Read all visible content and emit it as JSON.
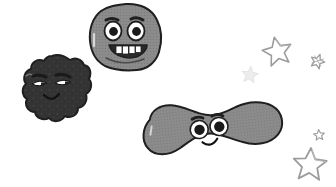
{
  "scene": {
    "title": "Cartoon germ characters illustration",
    "background_color": "#ffffff",
    "width": 336,
    "height": 187
  },
  "palette": {
    "background": "#ffffff",
    "mid_gray_body": "#8a8a8a",
    "mid_gray_body_shade": "#7b7b7b",
    "dark_body": "#333333",
    "dark_body_shade": "#262626",
    "outline_dark": "#1f1f1f",
    "outline_mid": "#4a4a4a",
    "eye_white": "#ffffff",
    "pupil": "#1a1a1a",
    "star_outline": "#9b9b9b",
    "star_fill_light": "#ededed",
    "speckle_light": "#a5a5a5",
    "speckle_dark": "#4f4f4f"
  },
  "characters": [
    {
      "id": "round-germ",
      "name": "Round smiling germ",
      "shape": "round-lumpy-blob",
      "body_color": "#8a8a8a",
      "outline_color": "#1f1f1f",
      "position": {
        "x": 90,
        "y": 3,
        "width": 72,
        "height": 68
      },
      "expression": "wide-open-grin",
      "face": {
        "eyes": 2,
        "eye_style": "large-round-white-with-black-pupil",
        "eyebrows": 2,
        "eyebrow_style": "short-thick-arched",
        "mouth": "wide-open-smile",
        "teeth": 4,
        "teeth_color": "#ffffff"
      }
    },
    {
      "id": "dark-germ",
      "name": "Dark lumpy germ",
      "shape": "cloud-lumpy-blob",
      "body_color": "#333333",
      "outline_color": "#1f1f1f",
      "position": {
        "x": 12,
        "y": 55,
        "width": 78,
        "height": 74
      },
      "expression": "sly-smirk",
      "face": {
        "eyes": 2,
        "eye_style": "narrow-almond-white-with-dark-pupil",
        "eyebrows": 2,
        "eyebrow_style": "thick-straight",
        "mouth": "small-curved-smile",
        "teeth": 0,
        "texture": "speckled-dots"
      }
    },
    {
      "id": "peanut-germ",
      "name": "Peanut shaped germ",
      "shape": "peanut-dumbbell-blob",
      "body_color": "#8a8a8a",
      "outline_color": "#1f1f1f",
      "position": {
        "x": 143,
        "y": 99,
        "width": 143,
        "height": 57
      },
      "rotation_deg": -6,
      "expression": "happy-smile",
      "face": {
        "eyes": 2,
        "eye_style": "round-white-with-dark-ring-and-black-pupil",
        "eyebrows": 2,
        "eyebrow_style": "short-thick-arched",
        "mouth": "small-curved-smile",
        "teeth": 0
      }
    }
  ],
  "stars": [
    {
      "id": "star-medium-top",
      "style": "outline",
      "outline_color": "#9b9b9b",
      "position": {
        "cx": 277,
        "cy": 50
      },
      "size": 26,
      "rotation_deg": -12
    },
    {
      "id": "star-small-left",
      "style": "filled-light",
      "fill_color": "#ededed",
      "position": {
        "cx": 250,
        "cy": 74
      },
      "size": 15,
      "rotation_deg": 8
    },
    {
      "id": "star-tiny-right",
      "style": "sketchy-outline",
      "outline_color": "#9b9b9b",
      "position": {
        "cx": 318,
        "cy": 60
      },
      "size": 12,
      "rotation_deg": 20
    },
    {
      "id": "star-tiny-bottom",
      "style": "sketchy-outline",
      "outline_color": "#9b9b9b",
      "position": {
        "cx": 319,
        "cy": 134
      },
      "size": 9,
      "rotation_deg": -5
    },
    {
      "id": "star-large-bottom",
      "style": "outline",
      "outline_color": "#9b9b9b",
      "position": {
        "cx": 310,
        "cy": 163
      },
      "size": 30,
      "rotation_deg": 4
    }
  ]
}
